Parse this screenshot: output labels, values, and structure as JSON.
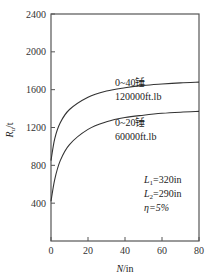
{
  "chart_data": {
    "type": "line",
    "title": "",
    "xlabel": "N/in",
    "ylabel": "R_u/t",
    "xlim": [
      0,
      80
    ],
    "ylim": [
      0,
      2400
    ],
    "x_ticks": [
      "0",
      "20",
      "40",
      "60",
      "80"
    ],
    "y_ticks": [
      "400",
      "800",
      "1200",
      "1600",
      "2000",
      "2400"
    ],
    "grid": false,
    "series": [
      {
        "name": "0~40锤 120000ft.lb",
        "label_line1": "0~40锤",
        "label_line2": "120000ft.lb",
        "x": [
          0,
          2,
          5,
          10,
          20,
          30,
          40,
          50,
          60,
          70,
          80
        ],
        "y": [
          850,
          1080,
          1250,
          1390,
          1520,
          1585,
          1620,
          1645,
          1660,
          1672,
          1680
        ]
      },
      {
        "name": "0~20锤 60000ft.lb",
        "label_line1": "0~20锤",
        "label_line2": "60000ft.lb",
        "x": [
          0,
          2,
          5,
          10,
          20,
          30,
          40,
          50,
          60,
          70,
          80
        ],
        "y": [
          420,
          650,
          850,
          1020,
          1180,
          1260,
          1305,
          1330,
          1350,
          1362,
          1370
        ]
      }
    ],
    "annotations": [
      "L1=320in",
      "L2=290in",
      "η=5%"
    ]
  },
  "labels": {
    "ylabel_main": "R",
    "ylabel_sub": "u",
    "ylabel_unit": "/t",
    "xlabel_main": "N",
    "xlabel_unit": "/in",
    "params": {
      "l1_main": "L",
      "l1_sub": "1",
      "l1_val": "=320in",
      "l2_main": "L",
      "l2_sub": "2",
      "l2_val": "=290in",
      "eta": "η=5%"
    }
  }
}
